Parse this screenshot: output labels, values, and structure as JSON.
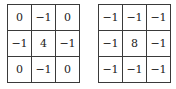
{
  "kernels": [
    {
      "name": "laplacian-4",
      "rows": [
        [
          "0",
          "−1",
          "0"
        ],
        [
          "−1",
          "4",
          "−1"
        ],
        [
          "0",
          "−1",
          "0"
        ]
      ]
    },
    {
      "name": "laplacian-8",
      "rows": [
        [
          "−1",
          "−1",
          "−1"
        ],
        [
          "−1",
          "8",
          "−1"
        ],
        [
          "−1",
          "−1",
          "−1"
        ]
      ]
    }
  ]
}
